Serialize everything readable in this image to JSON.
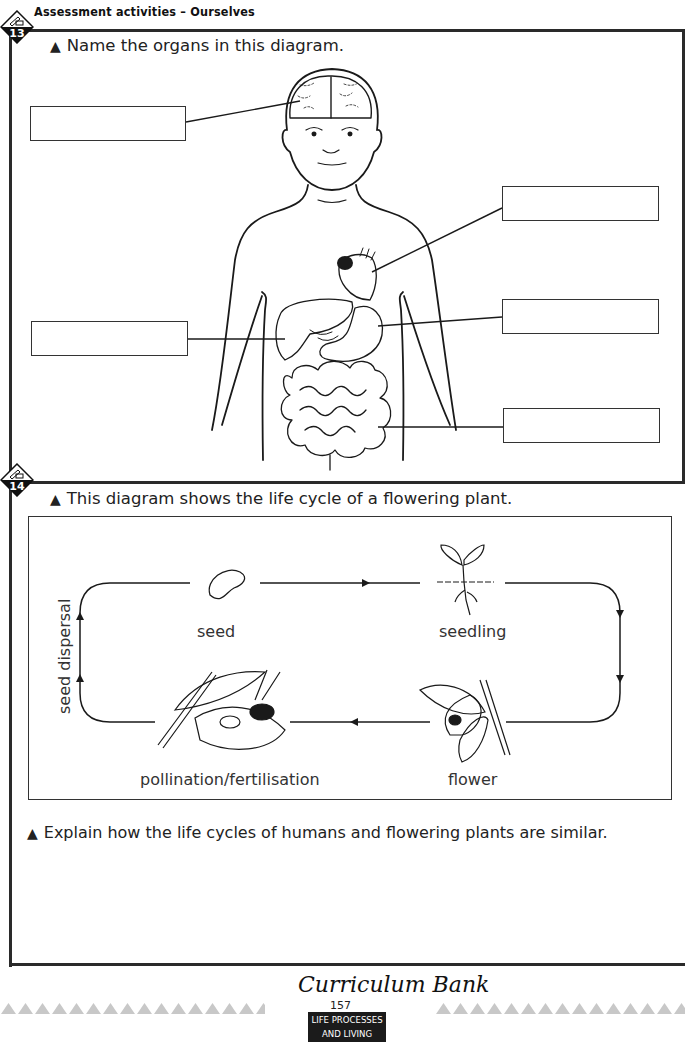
{
  "header": {
    "title": "Assessment activities – Ourselves"
  },
  "section13": {
    "number": "13",
    "instruction": "Name the organs in this diagram.",
    "label_boxes": [
      {
        "id": "brain",
        "value": ""
      },
      {
        "id": "heart",
        "value": ""
      },
      {
        "id": "liver",
        "value": ""
      },
      {
        "id": "stomach",
        "value": ""
      },
      {
        "id": "intestines",
        "value": ""
      }
    ]
  },
  "section14": {
    "number": "14",
    "instruction": "This diagram shows the life cycle of a flowering plant.",
    "cycle": {
      "stages": [
        "seed",
        "seedling",
        "flower",
        "pollination/fertilisation"
      ],
      "side_label": "seed dispersal"
    },
    "question": "Explain how the life cycles of humans and flowering plants are similar.",
    "answer": ""
  },
  "icons": {
    "bullet": "▲",
    "badge": "pencil-diamond-icon"
  },
  "footer": {
    "logo": "Curriculum Bank",
    "page_number": "157",
    "tag_line1": "LIFE PROCESSES",
    "tag_line2": "AND LIVING THINGS"
  },
  "colors": {
    "ink": "#1a1a1a",
    "tag_bg": "#1b1b1b",
    "footer_triangles": "#c8c8c8"
  }
}
